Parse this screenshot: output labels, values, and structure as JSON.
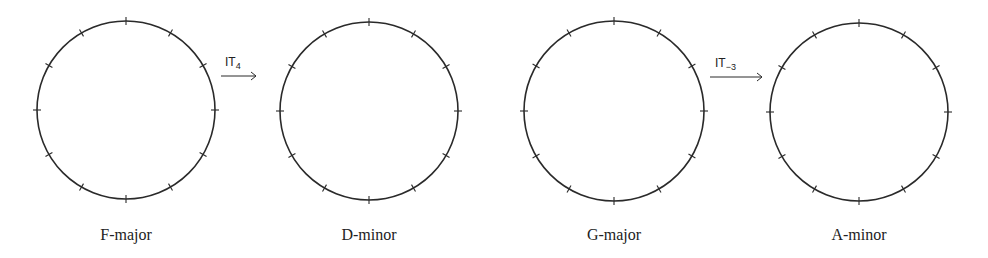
{
  "diagram": {
    "circles": [
      {
        "id": "f-major",
        "label": "F-major",
        "cx": 126,
        "cy": 110,
        "r": 89,
        "ticks": 12
      },
      {
        "id": "d-minor",
        "label": "D-minor",
        "cx": 369,
        "cy": 111,
        "r": 89,
        "ticks": 12
      },
      {
        "id": "g-major",
        "label": "G-major",
        "cx": 614,
        "cy": 111,
        "r": 90,
        "ticks": 12
      },
      {
        "id": "a-minor",
        "label": "A-minor",
        "cx": 859,
        "cy": 112,
        "r": 89,
        "ticks": 12
      }
    ],
    "arrows": [
      {
        "from": "f-major",
        "to": "d-minor",
        "op_base": "IT",
        "op_sub": "4"
      },
      {
        "from": "g-major",
        "to": "a-minor",
        "op_base": "IT",
        "op_sub": "−3"
      }
    ],
    "stroke_color": "#2a2a2a"
  }
}
